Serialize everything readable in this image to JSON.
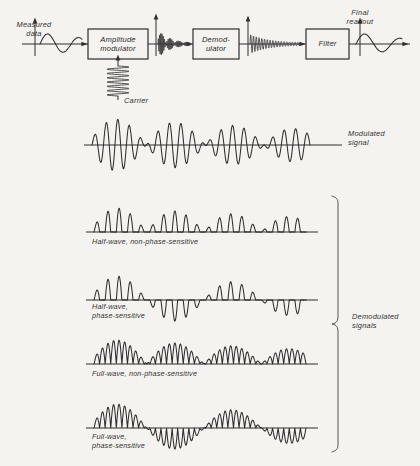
{
  "figure": {
    "background": "#f5f3f0",
    "ink": "#2f2e2c"
  },
  "block_diagram": {
    "input_label": "Measured\ndata",
    "carrier_label": "Carrier",
    "output_label": "Final\nreadout",
    "blocks": [
      {
        "id": "amplitude-modulator",
        "label": "Amplitude\nmodulator",
        "x": 88,
        "y": 29,
        "w": 60,
        "h": 30
      },
      {
        "id": "demodulator",
        "label": "Demod-\nulator",
        "x": 193,
        "y": 29,
        "w": 46,
        "h": 30
      },
      {
        "id": "filter",
        "label": "Filter",
        "x": 306,
        "y": 29,
        "w": 43,
        "h": 30
      }
    ],
    "axes": [
      {
        "id": "axis-input",
        "x": 35,
        "y": 44,
        "top": 22
      },
      {
        "id": "axis-mod",
        "x": 156,
        "y": 44,
        "top": 18
      },
      {
        "id": "axis-demod",
        "x": 248,
        "y": 44,
        "top": 20
      },
      {
        "id": "axis-output",
        "x": 360,
        "y": 44,
        "top": 22
      }
    ]
  },
  "modulated": {
    "label": "Modulated\nsignal",
    "baseline_y": 145,
    "x_start": 92,
    "x_end": 310,
    "carrier_cycles": 19,
    "amplitude": 27
  },
  "bracket": {
    "label": "Demodulated\nsignals",
    "x": 338,
    "y_top": 196,
    "y_bottom": 452
  },
  "demodulated": [
    {
      "id": "half-wave-non-phase-sensitive",
      "label": "Half-wave, non-phase-sensitive",
      "label_lines": 1,
      "baseline_y": 232,
      "x_start": 94,
      "x_end": 306,
      "rectify": "half",
      "phase_sensitive": false,
      "amplitude": 25,
      "lobes": 19
    },
    {
      "id": "half-wave-phase-sensitive",
      "label": "Half-wave,\nphase-sensitive",
      "label_lines": 2,
      "baseline_y": 300,
      "x_start": 94,
      "x_end": 306,
      "rectify": "half",
      "phase_sensitive": true,
      "amplitude": 25,
      "lobes": 19
    },
    {
      "id": "full-wave-non-phase-sensitive",
      "label": "Full-wave, non-phase-sensitive",
      "label_lines": 1,
      "baseline_y": 364,
      "x_start": 94,
      "x_end": 306,
      "rectify": "full",
      "phase_sensitive": false,
      "amplitude": 25,
      "lobes": 38
    },
    {
      "id": "full-wave-phase-sensitive",
      "label": "Full-wave,\nphase-sensitive",
      "label_lines": 2,
      "baseline_y": 428,
      "x_start": 94,
      "x_end": 306,
      "rectify": "full",
      "phase_sensitive": true,
      "amplitude": 25,
      "lobes": 38
    }
  ],
  "envelope": {
    "description": "amplitude envelope equals the measured-data sine; sign reverses after each zero crossing",
    "nodes": [
      0.0,
      0.3,
      0.56,
      0.8,
      1.0
    ],
    "peaks": [
      1.0,
      -0.78,
      0.62,
      -0.55
    ]
  }
}
